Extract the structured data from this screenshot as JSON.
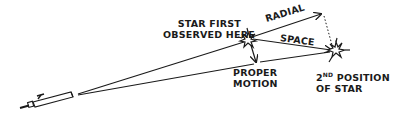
{
  "diagram": {
    "labels": {
      "first_position_line1": "STAR FIRST",
      "first_position_line2": "OBSERVED HERE",
      "radial": "RADIAL",
      "space": "SPACE",
      "proper_line1": "PROPER",
      "proper_line2": "MOTION",
      "second_position_number": "2",
      "second_position_ordinal": "ND",
      "second_position_line1_rest": " POSITION",
      "second_position_line2": "OF STAR"
    },
    "elements": {
      "observer": "telescope-icon",
      "star_first": "star-burst-icon",
      "star_second": "star-burst-icon"
    },
    "colors": {
      "ink": "#1a1a1a",
      "background": "#ffffff"
    }
  }
}
